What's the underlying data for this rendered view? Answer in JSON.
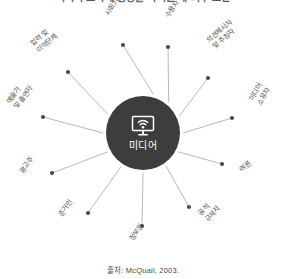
{
  "title": "미디어 조직에 영향을 미치는 내·외부 요인",
  "hub": {
    "label": "미디어",
    "icon": "monitor-wifi-icon",
    "color": "#3d3d3d"
  },
  "source": "출처: McQuail, 2003.",
  "colors": {
    "hub_fill": "#3d3d3d",
    "spoke_line": "#b0b0b0",
    "node_dot": "#4a4a4a",
    "text": "#4f4f4f"
  },
  "nodes": [
    {
      "id": "social-institutions",
      "label": "사회기관",
      "angle": -75,
      "rotate": -58,
      "dot_x": 123,
      "dot_y": 45,
      "text_x": 104,
      "text_y": 13
    },
    {
      "id": "audience",
      "label": "수용자",
      "angle": -50,
      "rotate": -58,
      "dot_x": 168,
      "dot_y": 47,
      "text_x": 164,
      "text_y": 15
    },
    {
      "id": "advocates",
      "label": "의견제시자\n및 주창자",
      "angle": -25,
      "rotate": -40,
      "dot_x": 208,
      "dot_y": 78,
      "text_x": 205,
      "text_y": 38
    },
    {
      "id": "media-owners",
      "label": "미디어\n소유자",
      "angle": 0,
      "rotate": -60,
      "dot_x": 232,
      "dot_y": 118,
      "text_x": 248,
      "text_y": 98
    },
    {
      "id": "public-opinion",
      "label": "여론",
      "angle": 28,
      "rotate": -42,
      "dot_x": 222,
      "dot_y": 164,
      "text_x": 238,
      "text_y": 168
    },
    {
      "id": "public-regulators",
      "label": "공적\n규제자",
      "angle": 55,
      "rotate": -48,
      "dot_x": 189,
      "dot_y": 207,
      "text_x": 197,
      "text_y": 212
    },
    {
      "id": "information-sources",
      "label": "정보원",
      "angle": 90,
      "rotate": -55,
      "dot_x": 142,
      "dot_y": 226,
      "text_x": 128,
      "text_y": 238
    },
    {
      "id": "reference-persons",
      "label": "준거인",
      "angle": 123,
      "rotate": -52,
      "dot_x": 88,
      "dot_y": 213,
      "text_x": 57,
      "text_y": 213
    },
    {
      "id": "advertisers",
      "label": "광고주",
      "angle": 152,
      "rotate": -52,
      "dot_x": 52,
      "dot_y": 173,
      "text_x": 18,
      "text_y": 170
    },
    {
      "id": "artists-performers",
      "label": "예술가\n및 출연자",
      "angle": 180,
      "rotate": -52,
      "dot_x": 43,
      "dot_y": 117,
      "text_x": 5,
      "text_y": 100
    },
    {
      "id": "pressure-groups",
      "label": "압력 및\n이익단체",
      "angle": -152,
      "rotate": -42,
      "dot_x": 68,
      "dot_y": 72,
      "text_x": 29,
      "text_y": 42
    }
  ]
}
